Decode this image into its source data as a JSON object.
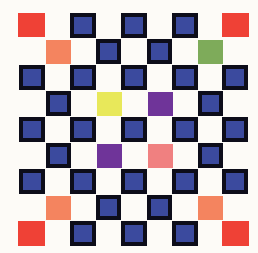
{
  "artwork": {
    "title": "Checkerboard Color Grid",
    "background_color": "#fdfbf7",
    "canvas": {
      "width": 258,
      "height": 253
    },
    "palette": {
      "blue_fill": "#3b4a9e",
      "blue_border": "#0d0d1a",
      "red": "#ef4136",
      "orange": "#f4845f",
      "green": "#7eab5a",
      "yellow": "#e8e85a",
      "purple": "#6f3499",
      "pink": "#f08080",
      "background": "#fdfbf7"
    },
    "grid": {
      "columns": 9,
      "rows": 9,
      "cell_size": 26,
      "origin_x": 18,
      "origin_y": 13,
      "tile_size": 25,
      "description": "Odd rows hold five tiles in odd columns; even rows hold four tiles in even columns."
    },
    "tiles": [
      {
        "id": "r1c1",
        "row": 1,
        "col": 1,
        "x": 18,
        "y": 13,
        "w": 27,
        "h": 24,
        "fill": "#ef4136",
        "border": "none",
        "framed": false,
        "name": "red-tile"
      },
      {
        "id": "r1c3",
        "row": 1,
        "col": 3,
        "x": 70,
        "y": 13,
        "w": 26,
        "h": 25,
        "fill": "#3b4a9e",
        "border": "#0d0d1a",
        "framed": true,
        "name": "blue-tile"
      },
      {
        "id": "r1c5",
        "row": 1,
        "col": 5,
        "x": 121,
        "y": 13,
        "w": 26,
        "h": 25,
        "fill": "#3b4a9e",
        "border": "#0d0d1a",
        "framed": true,
        "name": "blue-tile"
      },
      {
        "id": "r1c7",
        "row": 1,
        "col": 7,
        "x": 172,
        "y": 13,
        "w": 26,
        "h": 25,
        "fill": "#3b4a9e",
        "border": "#0d0d1a",
        "framed": true,
        "name": "blue-tile"
      },
      {
        "id": "r1c9",
        "row": 1,
        "col": 9,
        "x": 222,
        "y": 13,
        "w": 27,
        "h": 24,
        "fill": "#ef4136",
        "border": "none",
        "framed": false,
        "name": "red-tile"
      },
      {
        "id": "r2c2",
        "row": 2,
        "col": 2,
        "x": 46,
        "y": 40,
        "w": 25,
        "h": 24,
        "fill": "#f4845f",
        "border": "none",
        "framed": false,
        "name": "orange-tile"
      },
      {
        "id": "r2c4",
        "row": 2,
        "col": 4,
        "x": 96,
        "y": 39,
        "w": 25,
        "h": 25,
        "fill": "#3b4a9e",
        "border": "#0d0d1a",
        "framed": true,
        "name": "blue-tile"
      },
      {
        "id": "r2c6",
        "row": 2,
        "col": 6,
        "x": 147,
        "y": 39,
        "w": 25,
        "h": 25,
        "fill": "#3b4a9e",
        "border": "#0d0d1a",
        "framed": true,
        "name": "blue-tile"
      },
      {
        "id": "r2c8",
        "row": 2,
        "col": 8,
        "x": 198,
        "y": 40,
        "w": 25,
        "h": 24,
        "fill": "#7eab5a",
        "border": "none",
        "framed": false,
        "name": "green-tile"
      },
      {
        "id": "r3c1",
        "row": 3,
        "col": 1,
        "x": 19,
        "y": 65,
        "w": 26,
        "h": 25,
        "fill": "#3b4a9e",
        "border": "#0d0d1a",
        "framed": true,
        "name": "blue-tile"
      },
      {
        "id": "r3c3",
        "row": 3,
        "col": 3,
        "x": 70,
        "y": 65,
        "w": 26,
        "h": 25,
        "fill": "#3b4a9e",
        "border": "#0d0d1a",
        "framed": true,
        "name": "blue-tile"
      },
      {
        "id": "r3c5",
        "row": 3,
        "col": 5,
        "x": 121,
        "y": 65,
        "w": 26,
        "h": 25,
        "fill": "#3b4a9e",
        "border": "#0d0d1a",
        "framed": true,
        "name": "blue-tile"
      },
      {
        "id": "r3c7",
        "row": 3,
        "col": 7,
        "x": 172,
        "y": 65,
        "w": 26,
        "h": 25,
        "fill": "#3b4a9e",
        "border": "#0d0d1a",
        "framed": true,
        "name": "blue-tile"
      },
      {
        "id": "r3c9",
        "row": 3,
        "col": 9,
        "x": 222,
        "y": 65,
        "w": 26,
        "h": 25,
        "fill": "#3b4a9e",
        "border": "#0d0d1a",
        "framed": true,
        "name": "blue-tile"
      },
      {
        "id": "r4c2",
        "row": 4,
        "col": 2,
        "x": 46,
        "y": 91,
        "w": 25,
        "h": 25,
        "fill": "#3b4a9e",
        "border": "#0d0d1a",
        "framed": true,
        "name": "blue-tile"
      },
      {
        "id": "r4c4",
        "row": 4,
        "col": 4,
        "x": 97,
        "y": 92,
        "w": 25,
        "h": 24,
        "fill": "#e8e85a",
        "border": "none",
        "framed": false,
        "name": "yellow-tile"
      },
      {
        "id": "r4c6",
        "row": 4,
        "col": 6,
        "x": 148,
        "y": 92,
        "w": 25,
        "h": 24,
        "fill": "#6f3499",
        "border": "none",
        "framed": false,
        "name": "purple-tile"
      },
      {
        "id": "r4c8",
        "row": 4,
        "col": 8,
        "x": 198,
        "y": 91,
        "w": 25,
        "h": 25,
        "fill": "#3b4a9e",
        "border": "#0d0d1a",
        "framed": true,
        "name": "blue-tile"
      },
      {
        "id": "r5c1",
        "row": 5,
        "col": 1,
        "x": 19,
        "y": 117,
        "w": 26,
        "h": 25,
        "fill": "#3b4a9e",
        "border": "#0d0d1a",
        "framed": true,
        "name": "blue-tile"
      },
      {
        "id": "r5c3",
        "row": 5,
        "col": 3,
        "x": 70,
        "y": 117,
        "w": 26,
        "h": 25,
        "fill": "#3b4a9e",
        "border": "#0d0d1a",
        "framed": true,
        "name": "blue-tile"
      },
      {
        "id": "r5c5",
        "row": 5,
        "col": 5,
        "x": 121,
        "y": 117,
        "w": 26,
        "h": 25,
        "fill": "#3b4a9e",
        "border": "#0d0d1a",
        "framed": true,
        "name": "blue-tile"
      },
      {
        "id": "r5c7",
        "row": 5,
        "col": 7,
        "x": 172,
        "y": 117,
        "w": 26,
        "h": 25,
        "fill": "#3b4a9e",
        "border": "#0d0d1a",
        "framed": true,
        "name": "blue-tile"
      },
      {
        "id": "r5c9",
        "row": 5,
        "col": 9,
        "x": 222,
        "y": 117,
        "w": 26,
        "h": 25,
        "fill": "#3b4a9e",
        "border": "#0d0d1a",
        "framed": true,
        "name": "blue-tile"
      },
      {
        "id": "r6c2",
        "row": 6,
        "col": 2,
        "x": 46,
        "y": 143,
        "w": 25,
        "h": 25,
        "fill": "#3b4a9e",
        "border": "#0d0d1a",
        "framed": true,
        "name": "blue-tile"
      },
      {
        "id": "r6c4",
        "row": 6,
        "col": 4,
        "x": 97,
        "y": 144,
        "w": 25,
        "h": 24,
        "fill": "#6f3499",
        "border": "none",
        "framed": false,
        "name": "purple-tile"
      },
      {
        "id": "r6c6",
        "row": 6,
        "col": 6,
        "x": 148,
        "y": 144,
        "w": 25,
        "h": 24,
        "fill": "#f08080",
        "border": "none",
        "framed": false,
        "name": "pink-tile"
      },
      {
        "id": "r6c8",
        "row": 6,
        "col": 8,
        "x": 198,
        "y": 143,
        "w": 25,
        "h": 25,
        "fill": "#3b4a9e",
        "border": "#0d0d1a",
        "framed": true,
        "name": "blue-tile"
      },
      {
        "id": "r7c1",
        "row": 7,
        "col": 1,
        "x": 19,
        "y": 169,
        "w": 26,
        "h": 25,
        "fill": "#3b4a9e",
        "border": "#0d0d1a",
        "framed": true,
        "name": "blue-tile"
      },
      {
        "id": "r7c3",
        "row": 7,
        "col": 3,
        "x": 70,
        "y": 169,
        "w": 26,
        "h": 25,
        "fill": "#3b4a9e",
        "border": "#0d0d1a",
        "framed": true,
        "name": "blue-tile"
      },
      {
        "id": "r7c5",
        "row": 7,
        "col": 5,
        "x": 121,
        "y": 169,
        "w": 26,
        "h": 25,
        "fill": "#3b4a9e",
        "border": "#0d0d1a",
        "framed": true,
        "name": "blue-tile"
      },
      {
        "id": "r7c7",
        "row": 7,
        "col": 7,
        "x": 172,
        "y": 169,
        "w": 26,
        "h": 25,
        "fill": "#3b4a9e",
        "border": "#0d0d1a",
        "framed": true,
        "name": "blue-tile"
      },
      {
        "id": "r7c9",
        "row": 7,
        "col": 9,
        "x": 222,
        "y": 169,
        "w": 26,
        "h": 25,
        "fill": "#3b4a9e",
        "border": "#0d0d1a",
        "framed": true,
        "name": "blue-tile"
      },
      {
        "id": "r8c2",
        "row": 8,
        "col": 2,
        "x": 46,
        "y": 196,
        "w": 25,
        "h": 24,
        "fill": "#f4845f",
        "border": "none",
        "framed": false,
        "name": "orange-tile"
      },
      {
        "id": "r8c4",
        "row": 8,
        "col": 4,
        "x": 96,
        "y": 195,
        "w": 25,
        "h": 25,
        "fill": "#3b4a9e",
        "border": "#0d0d1a",
        "framed": true,
        "name": "blue-tile"
      },
      {
        "id": "r8c6",
        "row": 8,
        "col": 6,
        "x": 147,
        "y": 195,
        "w": 25,
        "h": 25,
        "fill": "#3b4a9e",
        "border": "#0d0d1a",
        "framed": true,
        "name": "blue-tile"
      },
      {
        "id": "r8c8",
        "row": 8,
        "col": 8,
        "x": 198,
        "y": 196,
        "w": 25,
        "h": 24,
        "fill": "#f4845f",
        "border": "none",
        "framed": false,
        "name": "orange-tile"
      },
      {
        "id": "r9c1",
        "row": 9,
        "col": 1,
        "x": 18,
        "y": 221,
        "w": 27,
        "h": 25,
        "fill": "#ef4136",
        "border": "none",
        "framed": false,
        "name": "red-tile"
      },
      {
        "id": "r9c3",
        "row": 9,
        "col": 3,
        "x": 70,
        "y": 221,
        "w": 26,
        "h": 25,
        "fill": "#3b4a9e",
        "border": "#0d0d1a",
        "framed": true,
        "name": "blue-tile"
      },
      {
        "id": "r9c5",
        "row": 9,
        "col": 5,
        "x": 121,
        "y": 221,
        "w": 26,
        "h": 25,
        "fill": "#3b4a9e",
        "border": "#0d0d1a",
        "framed": true,
        "name": "blue-tile"
      },
      {
        "id": "r9c7",
        "row": 9,
        "col": 7,
        "x": 172,
        "y": 221,
        "w": 26,
        "h": 25,
        "fill": "#3b4a9e",
        "border": "#0d0d1a",
        "framed": true,
        "name": "blue-tile"
      },
      {
        "id": "r9c9",
        "row": 9,
        "col": 9,
        "x": 222,
        "y": 221,
        "w": 27,
        "h": 25,
        "fill": "#ef4136",
        "border": "none",
        "framed": false,
        "name": "red-tile"
      }
    ]
  }
}
